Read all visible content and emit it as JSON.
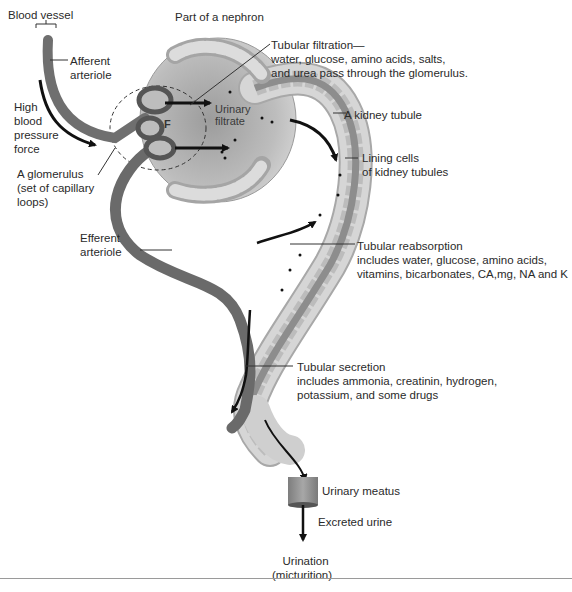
{
  "title": "Part of a nephron",
  "colors": {
    "vessel": "#6f6f6f",
    "vessel_dark": "#555555",
    "capsule": "#c8c8c8",
    "tubule_outer": "#bdbdbd",
    "tubule_lining": "#e4e4e4",
    "lumen": "#8a8a8a",
    "arrow": "#111111"
  },
  "labels": {
    "blood_vessel": "Blood vessel",
    "afferent": [
      "Afferent",
      "arteriole"
    ],
    "high_pressure": [
      "High",
      "blood",
      "pressure",
      "force"
    ],
    "glomerulus": [
      "A glomerulus",
      "(set of capillary",
      "loops)"
    ],
    "efferent": [
      "Efferent",
      "arteriole"
    ],
    "nephron_part": "Part of a nephron",
    "filtration": [
      "Tubular filtration—",
      "water, glucose, amino acids, salts,",
      "and urea pass through the glomerulus."
    ],
    "kidney_tubule": "A kidney tubule",
    "lining_cells": [
      "Lining cells",
      "of kidney tubules"
    ],
    "reabsorption": [
      "Tubular reabsorption",
      "includes water, glucose, amino acids,",
      "vitamins, bicarbonates, CA,mg, NA and K"
    ],
    "secretion": [
      "Tubular secretion",
      "includes ammonia, creatinin, hydrogen,",
      "potassium, and some drugs"
    ],
    "urinary_filtrate": [
      "Urinary",
      "filtrate"
    ],
    "filtration_marker": "F",
    "urinary_meatus": "Urinary meatus",
    "excreted_urine": "Excreted urine",
    "urination": [
      "Urination",
      "(micturition)"
    ]
  }
}
